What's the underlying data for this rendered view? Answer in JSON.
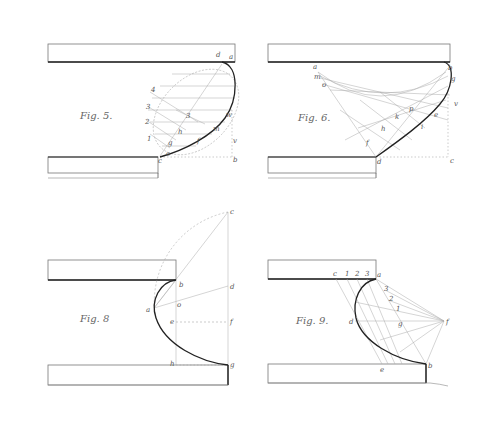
{
  "plate": {
    "background": "#ffffff",
    "ink": "#222222",
    "construction_ink": "#9a9a9a"
  },
  "figures": [
    {
      "id": "fig5",
      "caption": "Fig. 5.",
      "labels": {
        "d": "d",
        "a": "a",
        "n1": "4",
        "n2": "3",
        "n3": "2",
        "n4": "1",
        "s": "3",
        "h": "h",
        "g": "g",
        "e": "e",
        "w": "w",
        "m": "m",
        "f": "f",
        "v": "v",
        "b": "b",
        "c": "c"
      }
    },
    {
      "id": "fig6",
      "caption": "Fig. 6.",
      "labels": {
        "a": "a",
        "m": "m",
        "o": "o",
        "b": "b",
        "g": "g",
        "p": "p",
        "k": "k",
        "h": "h",
        "f": "f",
        "e": "e",
        "i": "i",
        "d": "d",
        "c": "c",
        "v": "v"
      }
    },
    {
      "id": "fig8",
      "caption": "Fig. 8",
      "labels": {
        "c": "c",
        "b": "b",
        "d": "d",
        "a": "a",
        "o": "o",
        "e": "e",
        "f": "f",
        "h": "h",
        "g": "g"
      }
    },
    {
      "id": "fig9",
      "caption": "Fig. 9.",
      "labels": {
        "c": "c",
        "n1": "1",
        "n2": "2",
        "n3": "3",
        "a": "a",
        "t3": "3",
        "t2": "2",
        "t1": "1",
        "d": "d",
        "g": "g",
        "f": "f",
        "e": "e",
        "b": "b"
      }
    }
  ]
}
